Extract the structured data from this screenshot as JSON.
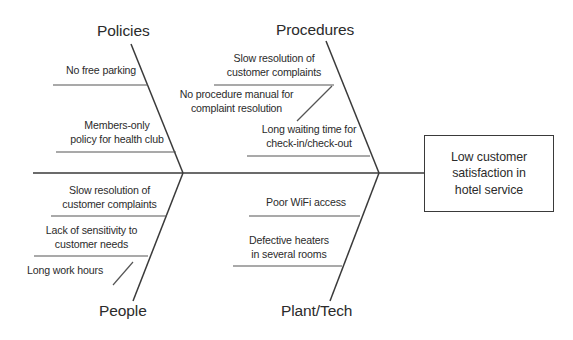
{
  "diagram": {
    "type": "fishbone-ishikawa",
    "effect": {
      "label": "Low customer\nsatisfaction in\nhotel service",
      "line1": "Low customer",
      "line2": "satisfaction in",
      "line3": "hotel service"
    },
    "spine": {
      "color": "#3a3a3a",
      "x_start": 33,
      "x_end": 424,
      "y": 173
    },
    "categories": [
      {
        "name": "Policies",
        "position": "top-left",
        "causes": [
          {
            "line1": "No free parking",
            "line2": ""
          },
          {
            "line1": "Members-only",
            "line2": "policy for health club"
          }
        ]
      },
      {
        "name": "Procedures",
        "position": "top-right",
        "causes": [
          {
            "line1": "Slow resolution of",
            "line2": "customer complaints"
          },
          {
            "line1": "No procedure manual for",
            "line2": "complaint resolution"
          },
          {
            "line1": "Long waiting time for",
            "line2": "check-in/check-out"
          }
        ]
      },
      {
        "name": "People",
        "position": "bottom-left",
        "causes": [
          {
            "line1": "Slow resolution of",
            "line2": "customer complaints"
          },
          {
            "line1": "Lack of sensitivity to",
            "line2": "customer needs"
          },
          {
            "line1": "Long work hours",
            "line2": ""
          }
        ]
      },
      {
        "name": "Plant/Tech",
        "position": "bottom-right",
        "causes": [
          {
            "line1": "Poor WiFi access",
            "line2": ""
          },
          {
            "line1": "Defective heaters",
            "line2": "in several rooms"
          }
        ]
      }
    ]
  },
  "colors": {
    "line": "#3a3a3a",
    "text": "#2b2b2b",
    "background": "#ffffff"
  }
}
